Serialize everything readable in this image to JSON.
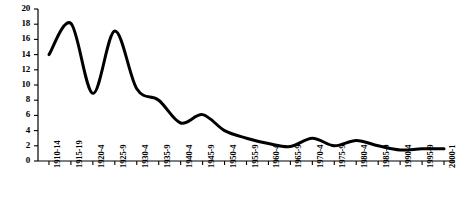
{
  "chart_data": {
    "type": "line",
    "title": "",
    "subtitle": "",
    "xlabel": "",
    "ylabel": "",
    "grid": false,
    "legend": "none",
    "ylim": [
      0,
      20
    ],
    "yticks": [
      0,
      2,
      4,
      6,
      8,
      10,
      12,
      14,
      16,
      18,
      20
    ],
    "ytick_labels": [
      "0",
      "2",
      "4",
      "6",
      "8",
      "10",
      "12",
      "14",
      "16",
      "18",
      "20"
    ],
    "categories": [
      "1910-14",
      "1915-19",
      "1920-4",
      "1925-9",
      "1930-4",
      "1935-9",
      "1940-4",
      "1945-9",
      "1950-4",
      "1955-9",
      "1960-4",
      "1965-9",
      "1970-4",
      "1975-9",
      "1980-4",
      "1985-9",
      "1990-4",
      "1995-9",
      "2000-1"
    ],
    "series": [
      {
        "name": "series-1",
        "color": "#000000",
        "line_width": 3,
        "values": [
          14.0,
          18.1,
          8.9,
          17.1,
          9.5,
          8.0,
          5.0,
          6.1,
          4.0,
          3.0,
          2.3,
          1.9,
          3.0,
          2.0,
          2.7,
          2.0,
          1.45,
          1.6,
          1.6
        ]
      }
    ]
  },
  "axes": {
    "y_axis_name": "y-axis",
    "x_axis_name": "x-axis"
  }
}
